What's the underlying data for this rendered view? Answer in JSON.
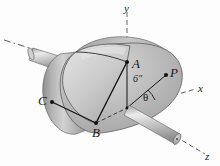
{
  "figure": {
    "background_color": "#fdfdfd",
    "body_color": "#b6b6b6",
    "shaft_color": "#c9c9c9",
    "line_color": "#1a1a1a",
    "dash_color": "#555555"
  },
  "points": {
    "A": "A",
    "B": "B",
    "C": "C",
    "P": "P"
  },
  "axes": {
    "x": "x",
    "y": "y",
    "z": "z"
  },
  "dimensions": {
    "radius": "6″"
  },
  "angles": {
    "theta": "θ"
  }
}
